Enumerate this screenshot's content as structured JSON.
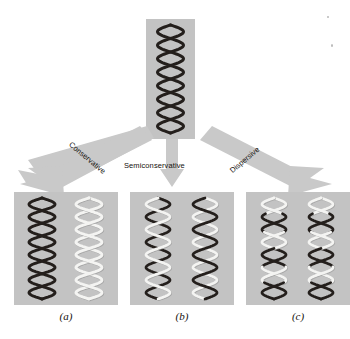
{
  "figure": {
    "background_color": "#ffffff",
    "panel_color": "#c3c3c3",
    "arrow_color": "#c9c9c9",
    "parent_strand_color": "#241f1c",
    "new_strand_color": "#f4f4f2"
  },
  "parent": {
    "name": "Parent DNA molecule",
    "strands": [
      {
        "id": "parent-strand-1",
        "color_class": "old",
        "description": "original dark strand"
      },
      {
        "id": "parent-strand-2",
        "color_class": "old",
        "description": "original dark strand"
      }
    ]
  },
  "arrows": [
    {
      "id": "arrow-conservative",
      "label": "Conservative",
      "direction": "down-left",
      "target_caption": "(a)"
    },
    {
      "id": "arrow-semiconservative",
      "label": "Semiconservative",
      "direction": "down",
      "target_caption": "(b)"
    },
    {
      "id": "arrow-dispersive",
      "label": "Dispersive",
      "direction": "down-right",
      "target_caption": "(c)"
    }
  ],
  "results": [
    {
      "id": "result-conservative",
      "caption": "(a)",
      "model": "Conservative",
      "molecules": [
        {
          "id": "a-molecule-1",
          "strands": [
            "old",
            "old"
          ],
          "description": "wholly parental duplex"
        },
        {
          "id": "a-molecule-2",
          "strands": [
            "new",
            "new"
          ],
          "description": "wholly newly synthesized duplex"
        }
      ]
    },
    {
      "id": "result-semiconservative",
      "caption": "(b)",
      "model": "Semiconservative",
      "molecules": [
        {
          "id": "b-molecule-1",
          "strands": [
            "old",
            "new"
          ],
          "description": "one parental and one new strand"
        },
        {
          "id": "b-molecule-2",
          "strands": [
            "old",
            "new"
          ],
          "description": "one parental and one new strand"
        }
      ]
    },
    {
      "id": "result-dispersive",
      "caption": "(c)",
      "model": "Dispersive",
      "molecules": [
        {
          "id": "c-molecule-1",
          "strands": [
            "mixed",
            "mixed"
          ],
          "description": "strands with interspersed old and new segments"
        },
        {
          "id": "c-molecule-2",
          "strands": [
            "mixed",
            "mixed"
          ],
          "description": "strands with interspersed old and new segments"
        }
      ]
    }
  ]
}
